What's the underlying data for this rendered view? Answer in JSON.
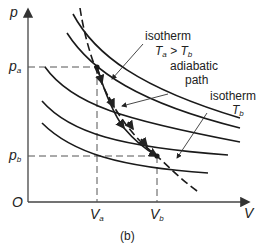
{
  "figure": {
    "caption": "(b)",
    "axes": {
      "y_label": "p",
      "x_label": "V",
      "origin_label": "O"
    },
    "ticks": {
      "pa": {
        "main": "p",
        "sub": "a"
      },
      "pb": {
        "main": "p",
        "sub": "b"
      },
      "va": {
        "main": "V",
        "sub": "a"
      },
      "vb": {
        "main": "V",
        "sub": "b"
      }
    },
    "annotations": {
      "isotherm_a_line1": "isotherm",
      "isotherm_a_T1": "T",
      "isotherm_a_T1_sub": "a",
      "isotherm_a_gt": " > ",
      "isotherm_a_T2": "T",
      "isotherm_a_T2_sub": "b",
      "adiabatic_line1": "adiabatic",
      "adiabatic_line2": "path",
      "isotherm_b_line1": "isotherm",
      "isotherm_b_T": "T",
      "isotherm_b_T_sub": "b"
    },
    "colors": {
      "curve": "#1a1a1a",
      "axis": "#444444",
      "dashed": "#555555",
      "text": "#222222"
    }
  }
}
